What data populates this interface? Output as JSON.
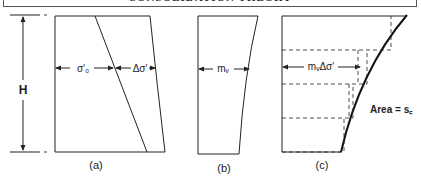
{
  "header": {
    "title": "CONSOLIDATION THEORY"
  },
  "dimension": {
    "label": "H"
  },
  "panels": [
    {
      "id": "a",
      "caption": "(a)",
      "labels": {
        "left": "σ′₀",
        "right": "Δσ′"
      }
    },
    {
      "id": "b",
      "caption": "(b)",
      "labels": {
        "center": "mᵥ"
      }
    },
    {
      "id": "c",
      "caption": "(c)",
      "labels": {
        "center": "mᵥΔσ′",
        "area": "Area = s꜀"
      }
    }
  ],
  "colors": {
    "line": "#222222",
    "background": "#ffffff"
  }
}
